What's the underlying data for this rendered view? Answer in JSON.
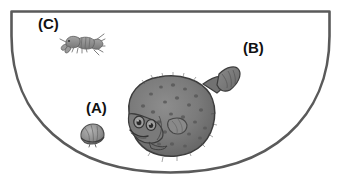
{
  "figure": {
    "type": "scientific-illustration",
    "background_color": "#ffffff",
    "tank": {
      "name": "semicircular-tank",
      "outline_color": "#5a5a5a",
      "fill_color": "#ffffff",
      "stroke_width": 2.6,
      "shape": "half-ellipse",
      "top_edge_y": 11,
      "left_edge_x": 11,
      "right_edge_x": 330,
      "bottom_y": 173
    },
    "labels": [
      {
        "id": "A",
        "text": "(A)",
        "x": 86,
        "y": 100,
        "refers_to": "bivalve-shell"
      },
      {
        "id": "B",
        "text": "(B)",
        "x": 243,
        "y": 40,
        "refers_to": "open-water-flatfish"
      },
      {
        "id": "C",
        "text": "(C)",
        "x": 38,
        "y": 16,
        "refers_to": "shrimp-crayfish"
      }
    ],
    "organisms": [
      {
        "id": "flatfish",
        "common_name": "flatfish",
        "icon": "flatfish-icon",
        "body_color": "#7d7d7d",
        "outline_color": "#3c3c3c",
        "spot_color": "#5b5b5b",
        "center_x": 175,
        "center_y": 118,
        "width": 98,
        "height": 78
      },
      {
        "id": "shrimp",
        "common_name": "shrimp",
        "icon": "shrimp-icon",
        "body_color": "#8f8f8f",
        "outline_color": "#5e5e5e",
        "center_x": 82,
        "center_y": 43,
        "width": 44,
        "height": 22
      },
      {
        "id": "shell",
        "common_name": "bivalve shell",
        "icon": "shell-icon",
        "body_color": "#9a9a9a",
        "outline_color": "#4e4e4e",
        "center_x": 92,
        "center_y": 135,
        "width": 26,
        "height": 22
      }
    ],
    "palette": {
      "outline": "#5a5a5a",
      "label_text": "#111111",
      "organism_mid": "#7d7d7d",
      "organism_dark": "#3c3c3c",
      "organism_light": "#a6a6a6"
    }
  }
}
